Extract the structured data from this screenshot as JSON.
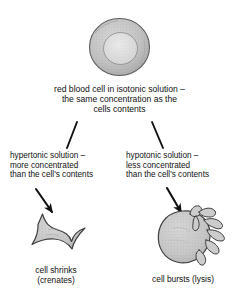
{
  "diagram": {
    "background_color": "#ffffff",
    "ink_color": "#111111",
    "cell_fill_color": "#c9c9c9",
    "cell_outline_color": "#4a4a4a",
    "nodes": {
      "isotonic": {
        "caption": "red blood cell in isotonic solution –\nthe same concentration as the\ncells contents",
        "cell_label": "biconcave-red-blood-cell"
      },
      "hypertonic": {
        "caption": "hypertonic solution –\nmore concentrated\nthan the cell's contents",
        "cell_label": "crenated-star-shaped-cell",
        "result_caption": "cell shrinks\n(crenates)"
      },
      "hypotonic": {
        "caption": "hypotonic solution –\nless concentrated\nthan the cell's contents",
        "cell_label": "lysed-bursting-cell",
        "result_caption": "cell bursts (lysis)"
      }
    },
    "connectors": [
      {
        "name": "isotonic-to-hypertonic-line",
        "style": "plain-line"
      },
      {
        "name": "isotonic-to-hypotonic-line",
        "style": "plain-line"
      },
      {
        "name": "hypertonic-to-crenated-arrow",
        "style": "solid-arrowhead"
      },
      {
        "name": "hypotonic-to-lysed-arrow",
        "style": "solid-arrowhead"
      }
    ]
  }
}
